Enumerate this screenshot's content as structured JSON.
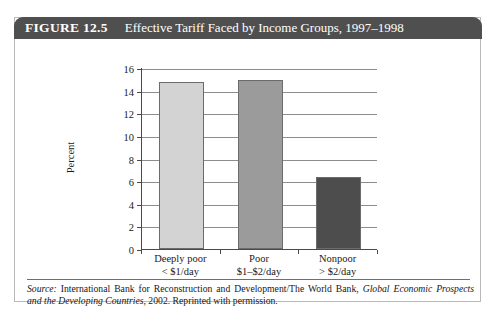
{
  "figure": {
    "tag": "FIGURE 12.5",
    "title": "Effective Tariff Faced by Income Groups, 1997–1998"
  },
  "source": {
    "label": "Source:",
    "text_before_italic": " International Bank for Reconstruction and Development/The World Bank, ",
    "italic_work": "Global Economic Prospects and the Developing Countries",
    "text_after_italic": ", 2002. Reprinted with permission."
  },
  "chart_data": {
    "type": "bar",
    "title": "Effective Tariff Faced by Income Groups, 1997–1998",
    "categories": [
      "Deeply poor",
      "Poor",
      "Nonpoor"
    ],
    "category_sublabels": [
      "< $1/day",
      "$1–$2/day",
      "> $2/day"
    ],
    "values": [
      14.8,
      14.9,
      6.4
    ],
    "bar_colors": [
      "#d3d3d3",
      "#9b9b9b",
      "#4d4d4d"
    ],
    "xlabel": "",
    "ylabel": "Percent",
    "ylim": [
      0,
      16
    ],
    "ytick_step": 2,
    "yticks": [
      0,
      2,
      4,
      6,
      8,
      10,
      12,
      14,
      16
    ],
    "ytick_labels": [
      "0",
      "2",
      "4",
      "6",
      "8",
      "10",
      "12",
      "14",
      "16"
    ],
    "grid": true,
    "legend": false
  }
}
